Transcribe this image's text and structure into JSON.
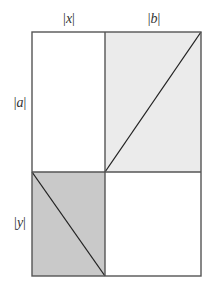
{
  "diagram": {
    "labels": {
      "top_left": "|x|",
      "top_right": "|b|",
      "left_upper": "|a|",
      "left_lower": "|y|"
    },
    "label_parts": {
      "x": "x",
      "b": "b",
      "a": "a",
      "y": "y",
      "bar": "|"
    },
    "geometry": {
      "outer": {
        "x0": 32,
        "y0": 32,
        "x1": 201,
        "y1": 276
      },
      "vertical_divider_x": 105,
      "horizontal_divider_y": 172
    },
    "cells": [
      {
        "id": "top-left",
        "fill": "#ffffff",
        "diagonal": false
      },
      {
        "id": "top-right",
        "fill": "#ebebeb",
        "diagonal": "bottom-left to top-right"
      },
      {
        "id": "bottom-left",
        "fill": "#c9c9c9",
        "diagonal": "top-left to bottom-right"
      },
      {
        "id": "bottom-right",
        "fill": "#ffffff",
        "diagonal": false
      }
    ],
    "colors": {
      "stroke": "#555555",
      "diagonal": "#222222",
      "light_shade": "#ebebeb",
      "dark_shade": "#c9c9c9",
      "text": "#333333"
    }
  }
}
